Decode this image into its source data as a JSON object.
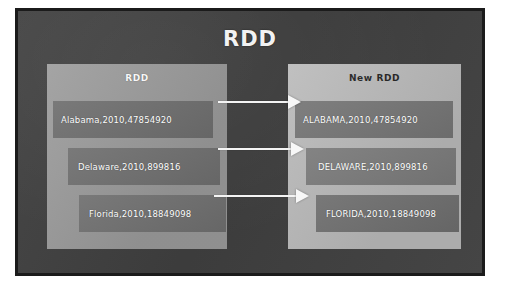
{
  "slide": {
    "title": "RDD",
    "accent_color": "#ffffff",
    "board_color": "#3f3f3f",
    "frame_border_color": "#1b1b1b"
  },
  "panels": {
    "source": {
      "label": "RDD",
      "background_color": "#9a9a9a",
      "records": [
        {
          "text": "Alabama,2010,47854920",
          "state": "Alabama",
          "year": "2010",
          "value": "47854920"
        },
        {
          "text": "Delaware,2010,899816",
          "state": "Delaware",
          "year": "2010",
          "value": "899816"
        },
        {
          "text": "Florida,2010,18849098",
          "state": "Florida",
          "year": "2010",
          "value": "18849098"
        }
      ]
    },
    "target": {
      "label": "New RDD",
      "background_color": "#b9b9b9",
      "records": [
        {
          "text": "ALABAMA,2010,47854920",
          "state": "ALABAMA",
          "year": "2010",
          "value": "47854920"
        },
        {
          "text": "DELAWARE,2010,899816",
          "state": "DELAWARE",
          "year": "2010",
          "value": "899816"
        },
        {
          "text": "FLORIDA,2010,18849098",
          "state": "FLORIDA",
          "year": "2010",
          "value": "18849098"
        }
      ]
    }
  },
  "arrows": [
    {
      "name": "arrow-alabama",
      "from": "Alabama,2010,47854920",
      "to": "ALABAMA,2010,47854920"
    },
    {
      "name": "arrow-delaware",
      "from": "Delaware,2010,899816",
      "to": "DELAWARE,2010,899816"
    },
    {
      "name": "arrow-florida",
      "from": "Florida,2010,18849098",
      "to": "FLORIDA,2010,18849098"
    }
  ]
}
